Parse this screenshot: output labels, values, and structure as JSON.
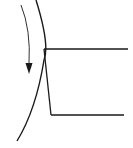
{
  "diagram": {
    "type": "cutting-tool-on-rotating-workpiece",
    "background": "#ffffff",
    "stroke_color": "#1a1a1a",
    "elements": {
      "workpiece_arc": {
        "label": "",
        "path": "M36,0 Q50,45 44,60 Q36,110 17,141",
        "stroke_width": 1.4
      },
      "rotation_arrow": {
        "label": "",
        "direction": "down",
        "path": "M21,5 Q31,30 29,64",
        "stroke_width": 0.9,
        "head_points": "25.5,63 32.5,63 29,74"
      },
      "tool": {
        "label": "",
        "top_edge": {
          "x1": 44,
          "y1": 49,
          "x2": 128,
          "y2": 49
        },
        "flank_edge": {
          "x1": 44,
          "y1": 49,
          "x2": 51,
          "y2": 115
        },
        "bottom_edge": {
          "x1": 51,
          "y1": 115,
          "x2": 124,
          "y2": 115
        },
        "stroke_width": 1.3
      }
    }
  }
}
